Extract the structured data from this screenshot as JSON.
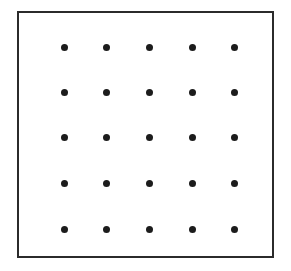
{
  "figure": {
    "background_color": "#ffffff",
    "frame": {
      "border_color": "#2b2b2b",
      "border_width_px": 2.5,
      "left_px": 17,
      "top_px": 11,
      "width_px": 257,
      "height_px": 247
    },
    "dots": {
      "color": "#1c1c1c",
      "shape": "circle",
      "diameter_px": 7,
      "rows": 5,
      "columns": 5,
      "count": 25,
      "column_centers_px": [
        45,
        87,
        130,
        173,
        215
      ],
      "row_centers_px": [
        34,
        79,
        124,
        170,
        216
      ],
      "column_spacing_px": 42.5,
      "row_spacing_px": 45.5,
      "points": [
        {
          "row": 1,
          "col": 1,
          "x": 45,
          "y": 34
        },
        {
          "row": 1,
          "col": 2,
          "x": 87,
          "y": 34
        },
        {
          "row": 1,
          "col": 3,
          "x": 130,
          "y": 34
        },
        {
          "row": 1,
          "col": 4,
          "x": 173,
          "y": 34
        },
        {
          "row": 1,
          "col": 5,
          "x": 215,
          "y": 34
        },
        {
          "row": 2,
          "col": 1,
          "x": 45,
          "y": 79
        },
        {
          "row": 2,
          "col": 2,
          "x": 87,
          "y": 79
        },
        {
          "row": 2,
          "col": 3,
          "x": 130,
          "y": 79
        },
        {
          "row": 2,
          "col": 4,
          "x": 173,
          "y": 79
        },
        {
          "row": 2,
          "col": 5,
          "x": 215,
          "y": 79
        },
        {
          "row": 3,
          "col": 1,
          "x": 45,
          "y": 124
        },
        {
          "row": 3,
          "col": 2,
          "x": 87,
          "y": 124
        },
        {
          "row": 3,
          "col": 3,
          "x": 130,
          "y": 124
        },
        {
          "row": 3,
          "col": 4,
          "x": 173,
          "y": 124
        },
        {
          "row": 3,
          "col": 5,
          "x": 215,
          "y": 124
        },
        {
          "row": 4,
          "col": 1,
          "x": 45,
          "y": 170
        },
        {
          "row": 4,
          "col": 2,
          "x": 87,
          "y": 170
        },
        {
          "row": 4,
          "col": 3,
          "x": 130,
          "y": 170
        },
        {
          "row": 4,
          "col": 4,
          "x": 173,
          "y": 170
        },
        {
          "row": 4,
          "col": 5,
          "x": 215,
          "y": 170
        },
        {
          "row": 5,
          "col": 1,
          "x": 45,
          "y": 216
        },
        {
          "row": 5,
          "col": 2,
          "x": 87,
          "y": 216
        },
        {
          "row": 5,
          "col": 3,
          "x": 130,
          "y": 216
        },
        {
          "row": 5,
          "col": 4,
          "x": 173,
          "y": 216
        },
        {
          "row": 5,
          "col": 5,
          "x": 215,
          "y": 216
        }
      ]
    }
  }
}
